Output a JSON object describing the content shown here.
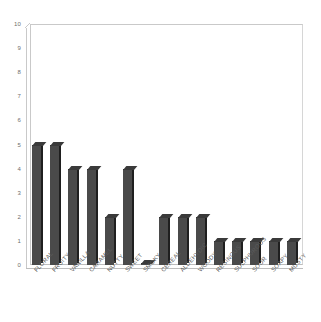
{
  "chart_data": {
    "type": "bar",
    "title": "",
    "subtitle": "",
    "xlabel": "",
    "ylabel": "",
    "ylim": [
      0,
      10
    ],
    "ytick_step": 1,
    "yticks": [
      0,
      1,
      2,
      3,
      4,
      5,
      6,
      7,
      8,
      9,
      10
    ],
    "ytick_labels": [
      "0",
      "1",
      "2",
      "3",
      "4",
      "5",
      "6",
      "7",
      "8",
      "9",
      "10"
    ],
    "grid": false,
    "legend": null,
    "style": "3d-columns",
    "bar_color": "#4a4a4a",
    "bar_side_color": "#1f1f1f",
    "bar_top_color": "#3a3a3a",
    "axis_color": "#c9c9c9",
    "label_color": "#5c5c5c",
    "background": "#ffffff",
    "categories": [
      "FLORAL",
      "FRUITY",
      "VANILLA",
      "CARAMEL",
      "NUTTY",
      "SWEET",
      "SMOKY",
      "CEREAL",
      "ALDEHYDIC",
      "WOODY",
      "RESINOUS",
      "SULPHUROUS",
      "SOUR",
      "SOAPY",
      "MUSTY"
    ],
    "values": [
      5,
      5,
      4,
      4,
      2,
      4,
      0,
      2,
      2,
      2,
      1,
      1,
      1,
      1,
      1
    ]
  }
}
